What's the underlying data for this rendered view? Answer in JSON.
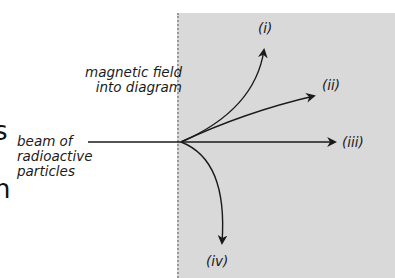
{
  "diagram": {
    "field_label": [
      "magnetic field",
      "into diagram"
    ],
    "beam_label": [
      "beam of",
      "radioactive",
      "particles"
    ],
    "clipped_left_text": [
      "s",
      "n"
    ],
    "paths": [
      {
        "id": "i",
        "label": "(i)",
        "direction": "curves upward"
      },
      {
        "id": "ii",
        "label": "(ii)",
        "direction": "slight upward"
      },
      {
        "id": "iii",
        "label": "(iii)",
        "direction": "straight, undeflected"
      },
      {
        "id": "iv",
        "label": "(iv)",
        "direction": "curves downward"
      }
    ],
    "colors": {
      "field_region": "#d9d9d9",
      "field_border": "#9a9a9a",
      "lines": "#1a1a1a"
    }
  }
}
